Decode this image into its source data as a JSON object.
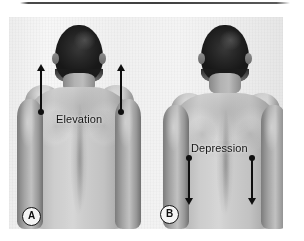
{
  "figure": {
    "caption_rule_visible": true,
    "panels": [
      {
        "id": "A",
        "badge_label": "A",
        "movement_label": "Elevation",
        "arrow_direction": "up",
        "arrow_count": 2
      },
      {
        "id": "B",
        "badge_label": "B",
        "movement_label": "Depression",
        "arrow_direction": "down",
        "arrow_count": 2
      }
    ]
  },
  "colors": {
    "annotation": "#121212",
    "rule": "#3f3f3f",
    "badge_fill": "#f3f2ef",
    "badge_border": "#17181a",
    "photo_background": "#efeeeb"
  },
  "icons": {
    "arrow_up": "arrow-up-icon",
    "arrow_down": "arrow-down-icon",
    "dot_marker": "dot-marker-icon"
  }
}
